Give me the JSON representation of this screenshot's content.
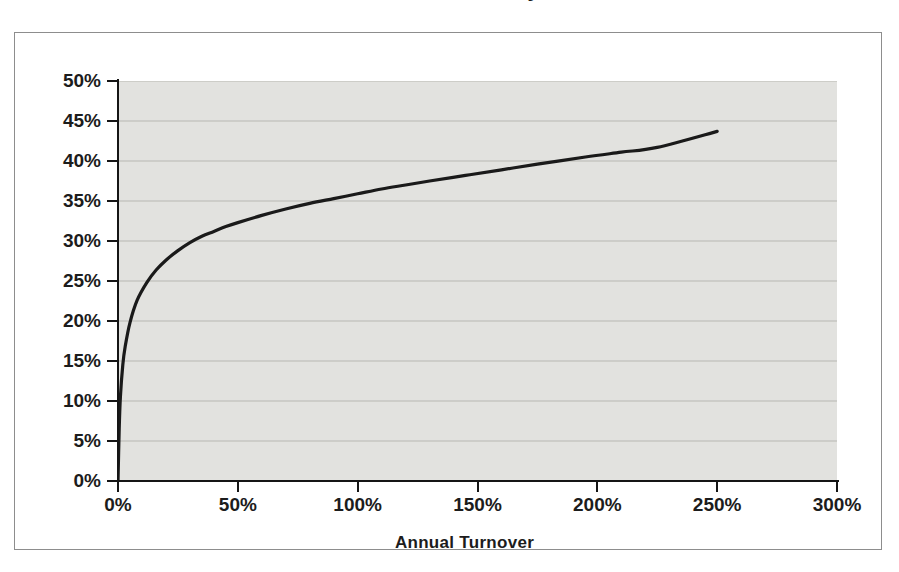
{
  "figure": {
    "title_fragment": "Annual Turnover vs. Recovery",
    "background_color": "#ffffff",
    "frame_color": "#8d8d8d"
  },
  "chart_data": {
    "type": "line",
    "title": "",
    "xlabel": "Annual Turnover",
    "ylabel": "",
    "xlim": [
      0,
      300
    ],
    "ylim": [
      0,
      50
    ],
    "grid": true,
    "legend": null,
    "x_tick_labels": [
      "0%",
      "50%",
      "100%",
      "150%",
      "200%",
      "250%",
      "300%"
    ],
    "x_tick_values": [
      0,
      50,
      100,
      150,
      200,
      250,
      300
    ],
    "y_tick_labels": [
      "0%",
      "5%",
      "10%",
      "15%",
      "20%",
      "25%",
      "30%",
      "35%",
      "40%",
      "45%",
      "50%"
    ],
    "y_tick_values": [
      0,
      5,
      10,
      15,
      20,
      25,
      30,
      35,
      40,
      45,
      50
    ],
    "series": [
      {
        "name": "Turnover curve",
        "color": "#1a1a1a",
        "line_width": 3.2,
        "x": [
          0,
          0.5,
          1,
          2,
          3,
          5,
          8,
          12,
          16,
          20,
          25,
          30,
          35,
          40,
          45,
          50,
          60,
          70,
          80,
          90,
          100,
          110,
          120,
          130,
          145,
          160,
          175,
          195,
          210,
          225,
          250
        ],
        "y": [
          0,
          6.5,
          10.5,
          14.5,
          16.8,
          19.8,
          22.6,
          24.8,
          26.4,
          27.6,
          28.8,
          29.8,
          30.6,
          31.2,
          31.8,
          32.3,
          33.2,
          34.0,
          34.7,
          35.3,
          35.9,
          36.5,
          37.0,
          37.5,
          38.2,
          38.9,
          39.6,
          40.5,
          41.1,
          41.7,
          43.7
        ]
      }
    ],
    "plot_background_color": "#e2e2df",
    "gridline_color": "#b7b7b2"
  },
  "axis_titles": {
    "x": "Annual Turnover"
  }
}
